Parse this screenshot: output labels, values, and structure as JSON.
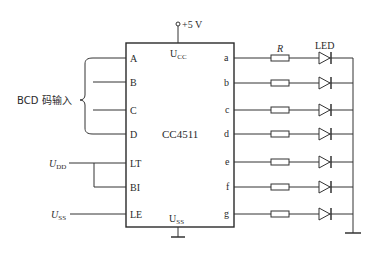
{
  "diagram": {
    "type": "circuit-schematic",
    "chip": {
      "name": "CC4511",
      "supply_top_label": "U",
      "supply_top_sub": "CC",
      "supply_bottom_label": "U",
      "supply_bottom_sub": "SS",
      "left_pins": [
        "A",
        "B",
        "C",
        "D",
        "LT",
        "BI",
        "LE"
      ],
      "right_pins": [
        "a",
        "b",
        "c",
        "d",
        "e",
        "f",
        "g"
      ]
    },
    "power": {
      "label": "+5 V"
    },
    "bcd_input": {
      "label": "BCD 码输入"
    },
    "udd": {
      "label": "U",
      "sub": "DD"
    },
    "uss": {
      "label": "U",
      "sub": "SS"
    },
    "resistor": {
      "label": "R"
    },
    "led": {
      "label": "LED"
    },
    "colors": {
      "line": "#333333",
      "text": "#2a2a2a",
      "background": "#ffffff"
    }
  }
}
